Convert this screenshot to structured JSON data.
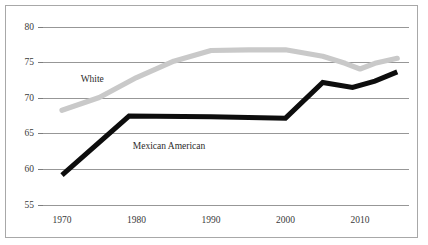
{
  "figure": {
    "background_color": "#ffffff",
    "border_color": "#a8a8a8"
  },
  "chart_data": {
    "type": "line",
    "title": "",
    "subtitle": "",
    "xlabel": "",
    "ylabel": "",
    "xlim": [
      1966,
      2016
    ],
    "ylim": [
      55,
      80
    ],
    "grid": true,
    "grid_axis": "y",
    "legend_position": "inline-annotation",
    "x_tick_labels": [
      "1970",
      "1980",
      "1990",
      "2000",
      "2010"
    ],
    "x_ticks": [
      1970,
      1980,
      1990,
      2000,
      2010
    ],
    "y_tick_labels": [
      "55",
      "60",
      "65",
      "70",
      "75",
      "80"
    ],
    "y_ticks": [
      55,
      60,
      65,
      70,
      75,
      80
    ],
    "series": [
      {
        "name": "White",
        "color": "#c9c9c9",
        "label_x": 1972.5,
        "label_y": 72.6,
        "x": [
          1970,
          1975,
          1980,
          1985,
          1990,
          1995,
          2000,
          2005,
          2008,
          2010,
          2012,
          2015
        ],
        "values": [
          68.3,
          70.1,
          72.9,
          75.2,
          76.7,
          76.8,
          76.8,
          75.9,
          74.9,
          74.1,
          74.9,
          75.6
        ]
      },
      {
        "name": "Mexican American",
        "color": "#0d0d0d",
        "label_x": 1979.5,
        "label_y": 63.2,
        "x": [
          1970,
          1979,
          1990,
          2000,
          2005,
          2009,
          2012,
          2015
        ],
        "values": [
          59.2,
          67.5,
          67.4,
          67.2,
          72.2,
          71.5,
          72.4,
          73.7
        ]
      }
    ],
    "annotations": [
      {
        "text": "White",
        "x": 1972.5,
        "y": 72.6
      },
      {
        "text": "Mexican American",
        "x": 1979.5,
        "y": 63.2
      }
    ]
  }
}
